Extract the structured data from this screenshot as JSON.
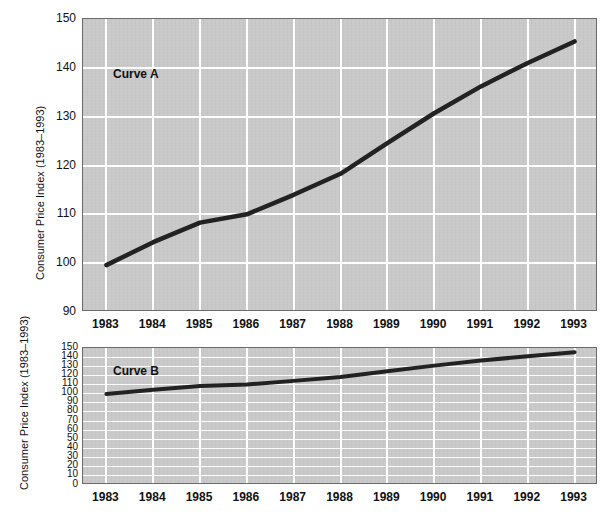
{
  "figure": {
    "background_color": "#ffffff",
    "plot_background_color": "#c9c9c9",
    "gridline_color": "#ffffff",
    "curve_color": "#222222",
    "axis_border_color": "#6b6b6b"
  },
  "chart_data": [
    {
      "type": "line",
      "id": "curve-a",
      "title": "",
      "annotation": "Curve A",
      "xlabel": "",
      "ylabel": "Consumer Price Index (1983–1993)",
      "x": [
        1983,
        1984,
        1985,
        1986,
        1987,
        1988,
        1989,
        1990,
        1991,
        1992,
        1993
      ],
      "categories": [
        "1983",
        "1984",
        "1985",
        "1986",
        "1987",
        "1988",
        "1989",
        "1990",
        "1991",
        "1992",
        "1993"
      ],
      "values": [
        99.6,
        104.3,
        108.3,
        110.0,
        114.0,
        118.3,
        124.6,
        130.7,
        136.2,
        141.0,
        145.4
      ],
      "xtick_labels": [
        "1983",
        "1984",
        "1985",
        "1986",
        "1987",
        "1988",
        "1989",
        "1990",
        "1991",
        "1992",
        "1993"
      ],
      "ytick_labels": [
        "150",
        "140",
        "130",
        "120",
        "110",
        "100",
        "90"
      ],
      "ytick_values": [
        150,
        140,
        130,
        120,
        110,
        100,
        90
      ],
      "ylim": [
        90,
        150
      ],
      "xlim": [
        1982.5,
        1993.5
      ],
      "grid": true,
      "legend": "none"
    },
    {
      "type": "line",
      "id": "curve-b",
      "title": "",
      "annotation": "Curve B",
      "xlabel": "",
      "ylabel": "Consumer Price Index (1983–1993)",
      "x": [
        1983,
        1984,
        1985,
        1986,
        1987,
        1988,
        1989,
        1990,
        1991,
        1992,
        1993
      ],
      "categories": [
        "1983",
        "1984",
        "1985",
        "1986",
        "1987",
        "1988",
        "1989",
        "1990",
        "1991",
        "1992",
        "1993"
      ],
      "values": [
        99.6,
        104.3,
        108.3,
        110.0,
        114.0,
        118.3,
        124.6,
        130.7,
        136.2,
        141.0,
        145.4
      ],
      "xtick_labels": [
        "1983",
        "1984",
        "1985",
        "1986",
        "1987",
        "1988",
        "1989",
        "1990",
        "1991",
        "1992",
        "1993"
      ],
      "ytick_labels": [
        "150",
        "140",
        "130",
        "120",
        "110",
        "100",
        "90",
        "80",
        "70",
        "60",
        "50",
        "40",
        "30",
        "20",
        "10",
        "0"
      ],
      "ytick_values": [
        150,
        140,
        130,
        120,
        110,
        100,
        90,
        80,
        70,
        60,
        50,
        40,
        30,
        20,
        10,
        0
      ],
      "ylim": [
        0,
        150
      ],
      "xlim": [
        1982.5,
        1993.5
      ],
      "grid": true,
      "legend": "none"
    }
  ]
}
